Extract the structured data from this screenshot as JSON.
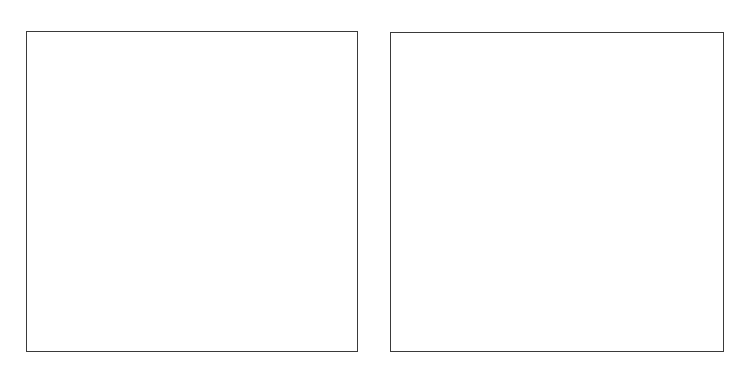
{
  "panels": [
    {
      "id": "left",
      "content": ""
    },
    {
      "id": "right",
      "content": ""
    }
  ],
  "ghost_text": {
    "line1": "",
    "line2": "",
    "line3": ""
  },
  "colors": {
    "background": "#ffffff",
    "border": "#3a3a3a"
  }
}
